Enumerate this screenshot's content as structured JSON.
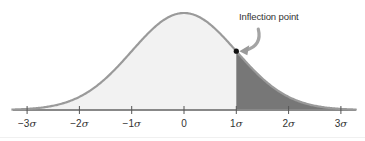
{
  "chart_data": {
    "type": "area",
    "title": "",
    "subtitle": "",
    "xlabel": "",
    "ylabel": "",
    "distribution": "normal",
    "mean": 0,
    "sd": 1,
    "xlim": [
      -3.3,
      3.3
    ],
    "ticks": [
      -3,
      -2,
      -1,
      0,
      1,
      2,
      3
    ],
    "tick_labels": [
      "−3σ",
      "−2σ",
      "−1σ",
      "0",
      "1σ",
      "2σ",
      "3σ"
    ],
    "grid": false,
    "legend": null,
    "shaded_region": {
      "from": 1,
      "to": 3.3,
      "label": ""
    },
    "annotations": [
      {
        "text": "Inflection point",
        "x": 1,
        "marker": "dot",
        "arrow": true
      }
    ],
    "colors": {
      "curve": "#9a9a9a",
      "fill_light": "#f2f2f2",
      "fill_dark": "#777777",
      "axis": "#888888",
      "tick": "#555555",
      "dot": "#111111",
      "arrow": "#9a9a9a"
    }
  },
  "axis": {
    "labels": [
      {
        "num": "−3",
        "sym": "σ"
      },
      {
        "num": "−2",
        "sym": "σ"
      },
      {
        "num": "−1",
        "sym": "σ"
      },
      {
        "num": "0",
        "sym": ""
      },
      {
        "num": "1",
        "sym": "σ"
      },
      {
        "num": "2",
        "sym": "σ"
      },
      {
        "num": "3",
        "sym": "σ"
      }
    ]
  },
  "annotation": {
    "text": "Inflection point"
  }
}
